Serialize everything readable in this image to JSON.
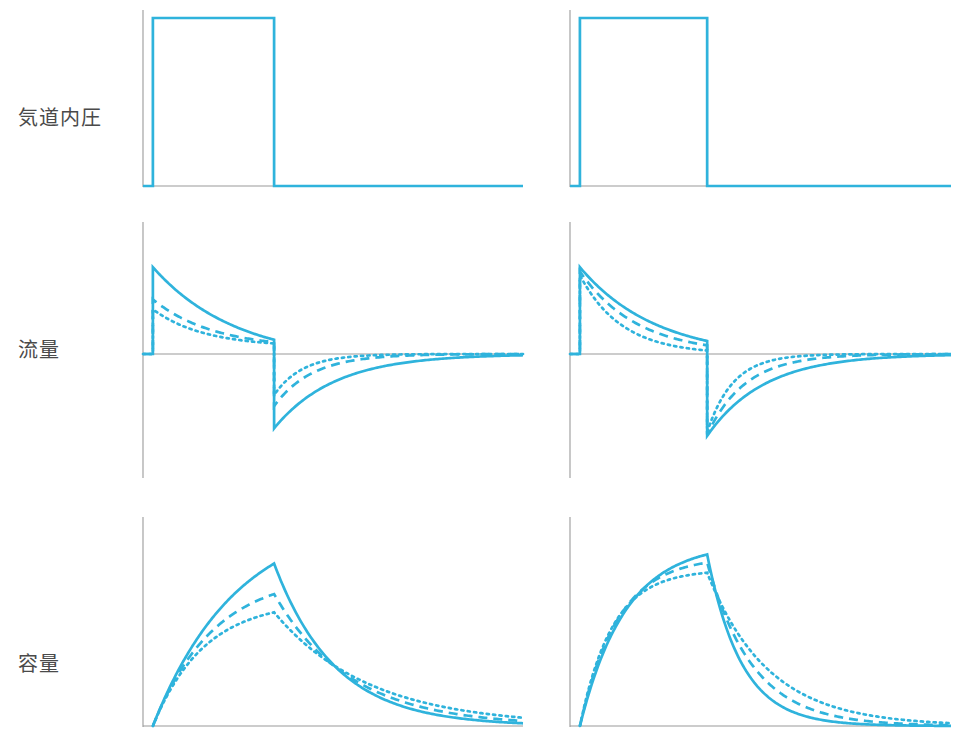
{
  "figure": {
    "title": "",
    "row_labels": [
      {
        "id": "pressure",
        "text": "気道内圧"
      },
      {
        "id": "flow",
        "text": "流量"
      },
      {
        "id": "volume",
        "text": "容量"
      }
    ],
    "accent_color": "#2FB3DC",
    "axis_color": "#9a9a9a",
    "label_color": "#4a4a4a",
    "background": "#ffffff"
  },
  "chart_data": [
    {
      "id": "pressure-left",
      "type": "line",
      "title": "気道内圧 (左)",
      "panel": "left",
      "row": "pressure",
      "xlabel": "",
      "ylabel": "気道内圧",
      "grid": false,
      "legend": "none",
      "xlim": [
        0,
        100
      ],
      "ylim": [
        0,
        1.1
      ],
      "axis_ticks": {
        "x": [],
        "y": []
      },
      "series": [
        {
          "name": "気道内圧",
          "style": "solid",
          "x": [
            0,
            2.6,
            2.6,
            34.5,
            34.5,
            100
          ],
          "y": [
            0,
            0,
            1.0,
            1.0,
            0,
            0
          ]
        }
      ]
    },
    {
      "id": "pressure-right",
      "type": "line",
      "title": "気道内圧 (右)",
      "panel": "right",
      "row": "pressure",
      "xlabel": "",
      "ylabel": "気道内圧",
      "grid": false,
      "legend": "none",
      "xlim": [
        0,
        100
      ],
      "ylim": [
        0,
        1.1
      ],
      "axis_ticks": {
        "x": [],
        "y": []
      },
      "series": [
        {
          "name": "気道内圧",
          "style": "solid",
          "x": [
            0,
            2.6,
            2.6,
            36.0,
            36.0,
            100
          ],
          "y": [
            0,
            0,
            1.0,
            1.0,
            0,
            0
          ]
        }
      ]
    },
    {
      "id": "flow-left",
      "type": "line",
      "title": "流量 (左)",
      "panel": "left",
      "row": "flow",
      "xlabel": "",
      "ylabel": "流量",
      "grid": false,
      "legend": "none",
      "xlim": [
        0,
        100
      ],
      "ylim": [
        -1.0,
        1.0
      ],
      "zero_line": true,
      "axis_ticks": {
        "x": [],
        "y": []
      },
      "notes": "吸気ピークは実線が最大、破線が中間、点線が最小。呼気は実線が最深で回復が最も遅い。",
      "series": [
        {
          "name": "実線 (コンプライアンス大 / 抵抗小)",
          "style": "solid",
          "insp_peak": 0.7,
          "insp_end": 0.115,
          "insp_tau": 22.0,
          "exp_peak": -0.6,
          "exp_tau": 16.0,
          "insp_start_x": 2.6,
          "insp_end_x": 34.5
        },
        {
          "name": "破線 (中間)",
          "style": "dashed",
          "insp_peak": 0.44,
          "insp_end": 0.095,
          "insp_tau": 16.0,
          "exp_peak": -0.42,
          "exp_tau": 10.0,
          "insp_start_x": 2.6,
          "insp_end_x": 34.5
        },
        {
          "name": "点線 (コンプライアンス小 / 抵抗大)",
          "style": "dotted",
          "insp_peak": 0.36,
          "insp_end": 0.085,
          "insp_tau": 13.5,
          "exp_peak": -0.33,
          "exp_tau": 7.5,
          "insp_start_x": 2.6,
          "insp_end_x": 34.5
        }
      ]
    },
    {
      "id": "flow-right",
      "type": "line",
      "title": "流量 (右)",
      "panel": "right",
      "row": "flow",
      "xlabel": "",
      "ylabel": "流量",
      "grid": false,
      "legend": "none",
      "xlim": [
        0,
        100
      ],
      "ylim": [
        -1.0,
        1.0
      ],
      "zero_line": true,
      "axis_ticks": {
        "x": [],
        "y": []
      },
      "notes": "吸気ピークはほぼ同一。減衰速度は点線が最速、実線が最も緩やか。呼気も同様に実線の回復が最も遅い。",
      "series": [
        {
          "name": "実線",
          "style": "solid",
          "insp_peak": 0.7,
          "insp_end": 0.105,
          "insp_tau": 20.0,
          "exp_peak": -0.66,
          "exp_tau": 15.0,
          "insp_start_x": 2.6,
          "insp_end_x": 36.0
        },
        {
          "name": "破線",
          "style": "dashed",
          "insp_peak": 0.665,
          "insp_end": 0.07,
          "insp_tau": 15.0,
          "exp_peak": -0.65,
          "exp_tau": 10.0,
          "insp_start_x": 2.6,
          "insp_end_x": 36.0
        },
        {
          "name": "点線",
          "style": "dotted",
          "insp_peak": 0.635,
          "insp_end": 0.028,
          "insp_tau": 11.0,
          "exp_peak": -0.63,
          "exp_tau": 6.8,
          "insp_start_x": 2.6,
          "insp_end_x": 36.0
        }
      ]
    },
    {
      "id": "volume-left",
      "type": "line",
      "title": "容量 (左)",
      "panel": "left",
      "row": "volume",
      "xlabel": "",
      "ylabel": "容量",
      "grid": false,
      "legend": "none",
      "xlim": [
        0,
        100
      ],
      "ylim": [
        0,
        1.0
      ],
      "axis_ticks": {
        "x": [],
        "y": []
      },
      "notes": "実線の一回換気量が最大、点線が最小。呼気では実線が最も速く基線に戻る。",
      "series": [
        {
          "name": "実線",
          "style": "solid",
          "peak": 0.8,
          "insp_tau": 22.0,
          "exp_tau": 16.0,
          "insp_start_x": 2.6,
          "insp_end_x": 34.5
        },
        {
          "name": "破線",
          "style": "dashed",
          "peak": 0.65,
          "insp_tau": 16.0,
          "exp_tau": 20.0,
          "insp_start_x": 2.6,
          "insp_end_x": 34.5
        },
        {
          "name": "点線",
          "style": "dotted",
          "peak": 0.56,
          "insp_tau": 13.5,
          "exp_tau": 25.0,
          "insp_start_x": 2.6,
          "insp_end_x": 34.5
        }
      ]
    },
    {
      "id": "volume-right",
      "type": "line",
      "title": "容量 (右)",
      "panel": "right",
      "row": "volume",
      "xlabel": "",
      "ylabel": "容量",
      "grid": false,
      "legend": "none",
      "xlim": [
        0,
        100
      ],
      "ylim": [
        0,
        1.0
      ],
      "axis_ticks": {
        "x": [],
        "y": []
      },
      "notes": "いずれも吸気終末にプラトーへ近づく。実線が最大容量、点線が最小。呼気は実線が最も速く減衰。",
      "series": [
        {
          "name": "実線",
          "style": "solid",
          "peak": 0.845,
          "insp_tau": 12.0,
          "exp_tau": 9.0,
          "insp_start_x": 2.6,
          "insp_end_x": 36.0
        },
        {
          "name": "破線",
          "style": "dashed",
          "peak": 0.805,
          "insp_tau": 10.0,
          "exp_tau": 12.0,
          "insp_start_x": 2.6,
          "insp_end_x": 36.0
        },
        {
          "name": "点線",
          "style": "dotted",
          "peak": 0.755,
          "insp_tau": 8.5,
          "exp_tau": 16.0,
          "insp_start_x": 2.6,
          "insp_end_x": 36.0
        }
      ]
    }
  ]
}
